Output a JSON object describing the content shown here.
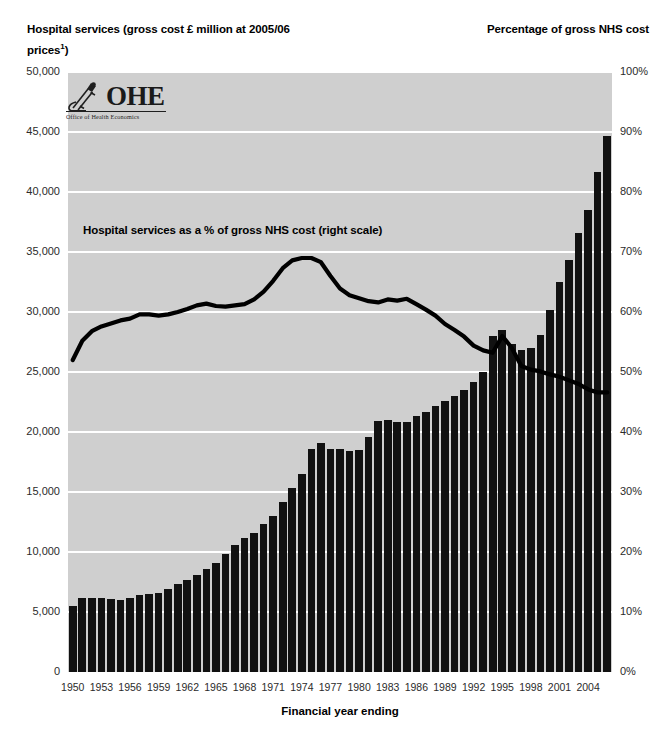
{
  "titles": {
    "left_axis": "Hospital services (gross cost £ million at 2005/06 prices",
    "left_axis_superscript": "1",
    "left_axis_tail": ")",
    "right_axis": "Percentage of gross NHS cost",
    "x_axis": "Financial year ending"
  },
  "logo": {
    "name": "OHE",
    "subtitle": "Office of Health Economics",
    "icon": "microscope-icon"
  },
  "annotation": "Hospital services as a % of gross NHS cost (right scale)",
  "colors": {
    "plot_background": "#cfcfcf",
    "gridline": "#ffffff",
    "bar": "#111111",
    "line": "#000000",
    "page_background": "#ffffff",
    "tick_text": "#2b2b2b"
  },
  "chart_data": {
    "type": "bar",
    "title": "",
    "subtitle": "",
    "xlabel": "Financial year ending",
    "ylabel": "Hospital services (gross cost £ million at 2005/06 prices)",
    "y2label": "Percentage of gross NHS cost",
    "grid": true,
    "legend_position": "inline-annotation",
    "ylim": [
      0,
      50000
    ],
    "y2lim": [
      0,
      100
    ],
    "ytick_labels": [
      "50,000",
      "45,000",
      "40,000",
      "35,000",
      "30,000",
      "25,000",
      "20,000",
      "15,000",
      "10,000",
      "5,000",
      "0"
    ],
    "ytick_values": [
      50000,
      45000,
      40000,
      35000,
      30000,
      25000,
      20000,
      15000,
      10000,
      5000,
      0
    ],
    "y2tick_labels": [
      "100%",
      "90%",
      "80%",
      "70%",
      "60%",
      "50%",
      "40%",
      "30%",
      "20%",
      "10%",
      "0%"
    ],
    "y2tick_values": [
      100,
      90,
      80,
      70,
      60,
      50,
      40,
      30,
      20,
      10,
      0
    ],
    "xtick_labels": [
      "1950",
      "1953",
      "1956",
      "1959",
      "1962",
      "1965",
      "1968",
      "1971",
      "1974",
      "1977",
      "1980",
      "1983",
      "1986",
      "1989",
      "1992",
      "1995",
      "1998",
      "2001",
      "2004"
    ],
    "x": [
      1950,
      1951,
      1952,
      1953,
      1954,
      1955,
      1956,
      1957,
      1958,
      1959,
      1960,
      1961,
      1962,
      1963,
      1964,
      1965,
      1966,
      1967,
      1968,
      1969,
      1970,
      1971,
      1972,
      1973,
      1974,
      1975,
      1976,
      1977,
      1978,
      1979,
      1980,
      1981,
      1982,
      1983,
      1984,
      1985,
      1986,
      1987,
      1988,
      1989,
      1990,
      1991,
      1992,
      1993,
      1994,
      1995,
      1996,
      1997,
      1998,
      1999,
      2000,
      2001,
      2002,
      2003,
      2004,
      2005,
      2006
    ],
    "series": [
      {
        "name": "Hospital services (gross cost £ million at 2005/06 prices)",
        "type": "bar",
        "axis": "left",
        "values": [
          5500,
          6200,
          6150,
          6150,
          6050,
          6000,
          6200,
          6400,
          6500,
          6600,
          6900,
          7300,
          7700,
          8100,
          8600,
          9100,
          9800,
          10600,
          11200,
          11600,
          12300,
          13000,
          14200,
          15300,
          16500,
          18600,
          19100,
          18600,
          18550,
          18400,
          18500,
          19600,
          20900,
          21000,
          20800,
          20800,
          21300,
          21700,
          22200,
          22600,
          23000,
          23500,
          24200,
          25000,
          28000,
          28500,
          27300,
          26800,
          27000,
          28100,
          30200,
          32500,
          34300,
          36600,
          38500,
          41700,
          44700
        ]
      },
      {
        "name": "Hospital services as a % of gross NHS cost",
        "type": "line",
        "axis": "right",
        "values": [
          52.0,
          55.2,
          56.8,
          57.6,
          58.1,
          58.6,
          58.9,
          59.6,
          59.6,
          59.4,
          59.6,
          60.0,
          60.5,
          61.1,
          61.4,
          61.0,
          60.9,
          61.1,
          61.3,
          62.1,
          63.4,
          65.2,
          67.3,
          68.6,
          69.0,
          69.0,
          68.3,
          66.0,
          63.9,
          62.8,
          62.3,
          61.8,
          61.6,
          62.1,
          61.9,
          62.2,
          61.3,
          60.4,
          59.4,
          58.0,
          57.0,
          55.9,
          54.4,
          53.6,
          53.2,
          56.0,
          54.0,
          51.0,
          50.4,
          50.1,
          49.6,
          49.2,
          48.6,
          48.0,
          47.1,
          46.6,
          46.6
        ]
      }
    ]
  }
}
